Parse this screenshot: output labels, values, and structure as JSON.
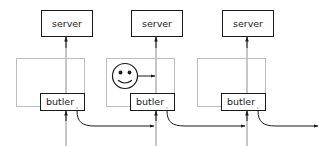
{
  "diagram": {
    "canvas": {
      "width": 326,
      "height": 146,
      "background": "#ffffff"
    },
    "colors": {
      "stroke_dark": "#1a1a1a",
      "stroke_gray": "#8d8d8d",
      "outer_box_gray": "#bdbdbd",
      "fill_white": "#ffffff"
    },
    "units": [
      {
        "id": "unit-1",
        "server_label": "server",
        "butler_label": "butler",
        "butler_subscript": ",",
        "has_user": false,
        "column_x": 66,
        "outer_box": {
          "x": 16,
          "y": 58,
          "w": 68,
          "h": 48
        },
        "server_box": {
          "x": 41,
          "y": 10,
          "w": 51,
          "h": 26
        },
        "butler_box": {
          "x": 40,
          "y": 93,
          "w": 44,
          "h": 17
        }
      },
      {
        "id": "unit-2",
        "server_label": "server",
        "butler_label": "butler",
        "butler_subscript": ",",
        "has_user": true,
        "user_icon": "smiley-face-icon",
        "column_x": 156,
        "outer_box": {
          "x": 106,
          "y": 58,
          "w": 68,
          "h": 48
        },
        "server_box": {
          "x": 131,
          "y": 10,
          "w": 51,
          "h": 26
        },
        "butler_box": {
          "x": 130,
          "y": 93,
          "w": 44,
          "h": 17
        }
      },
      {
        "id": "unit-3",
        "server_label": "server",
        "butler_label": "butler",
        "butler_subscript": ",",
        "has_user": false,
        "column_x": 247,
        "outer_box": {
          "x": 197,
          "y": 58,
          "w": 68,
          "h": 48
        },
        "server_box": {
          "x": 222,
          "y": 10,
          "w": 51,
          "h": 26
        },
        "butler_box": {
          "x": 221,
          "y": 93,
          "w": 44,
          "h": 17
        }
      }
    ],
    "connectors": [
      {
        "id": "chain-1-to-2",
        "from": "unit-1",
        "to": "unit-2",
        "direction": "right"
      },
      {
        "id": "chain-2-to-3",
        "from": "unit-2",
        "to": "unit-3",
        "direction": "right"
      },
      {
        "id": "chain-3-to-out",
        "from": "unit-3",
        "to": "outside",
        "direction": "right"
      }
    ]
  }
}
